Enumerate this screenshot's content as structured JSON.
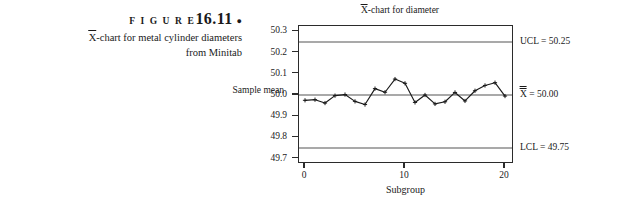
{
  "caption": {
    "figure_label": "F I G U R E",
    "figure_number": "16.11",
    "bullet": "●",
    "line1_prefix": "X",
    "line1_rest": "-chart for metal cylinder diameters",
    "line2": "from Minitab"
  },
  "chart": {
    "title_prefix": "X",
    "title_rest": "-chart for diameter",
    "y_axis_title": "Sample mean",
    "x_axis_title": "Subgroup",
    "y_ticks": [
      "50.3",
      "50.2",
      "50.1",
      "50.0",
      "49.9",
      "49.8",
      "49.7"
    ],
    "x_ticks": [
      "0",
      "10",
      "20"
    ],
    "annotations": {
      "ucl": "UCL = 50.25",
      "center_prefix": "X",
      "center_rest": " = 50.00",
      "lcl": "LCL = 49.75"
    },
    "colors": {
      "frame": "#2b2b2b",
      "control_line": "#a9a9a9",
      "series": "#1a1a1a",
      "background": "#ffffff"
    }
  },
  "chart_data": {
    "type": "line",
    "xlabel": "Subgroup",
    "ylabel": "Sample mean",
    "xlim": [
      -0.6,
      20.9
    ],
    "ylim": [
      49.675,
      50.325
    ],
    "xticks": [
      0,
      10,
      20
    ],
    "yticks": [
      50.3,
      50.2,
      50.1,
      50.0,
      49.9,
      49.8,
      49.7
    ],
    "grid": false,
    "legend": false,
    "marker": "plus",
    "control_limits": {
      "ucl": 50.25,
      "center": 50.0,
      "lcl": 49.75
    },
    "x": [
      0,
      1,
      2,
      3,
      4,
      5,
      6,
      7,
      8,
      9,
      10,
      11,
      12,
      13,
      14,
      15,
      16,
      17,
      18,
      19,
      20
    ],
    "values": [
      49.975,
      49.978,
      49.962,
      49.997,
      50.002,
      49.97,
      49.955,
      50.03,
      50.013,
      50.075,
      50.055,
      49.965,
      50.0,
      49.958,
      49.968,
      50.012,
      49.972,
      50.02,
      50.045,
      50.058,
      49.995
    ],
    "series": [
      {
        "name": "Sample mean",
        "values": [
          49.975,
          49.978,
          49.962,
          49.997,
          50.002,
          49.97,
          49.955,
          50.03,
          50.013,
          50.075,
          50.055,
          49.965,
          50.0,
          49.958,
          49.968,
          50.012,
          49.972,
          50.02,
          50.045,
          50.058,
          49.995
        ]
      }
    ],
    "points_out_of_control": []
  }
}
